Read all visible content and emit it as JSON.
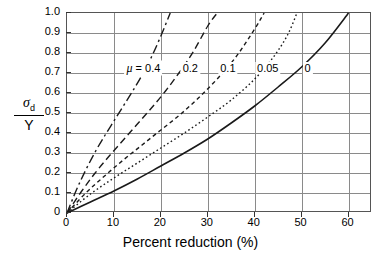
{
  "chart_data": {
    "type": "line",
    "title": "",
    "xlabel": "Percent reduction (%)",
    "ylabel": "σd/Y",
    "ylabel_numerator": "σ",
    "ylabel_numerator_sub": "d",
    "ylabel_denominator": "Y",
    "xlim": [
      0,
      65
    ],
    "ylim": [
      0,
      1.0
    ],
    "grid": true,
    "legend_position": "inline-on-curves",
    "xticks": [
      0,
      10,
      20,
      30,
      40,
      50,
      60
    ],
    "xticklabels": [
      "0",
      "10",
      "20",
      "30",
      "40",
      "50",
      "60"
    ],
    "yticks": [
      0,
      0.1,
      0.2,
      0.3,
      0.4,
      0.5,
      0.6,
      0.7,
      0.8,
      0.9,
      1.0
    ],
    "yticklabels": [
      "0",
      "0.1",
      "0.2",
      "0.3",
      "0.4",
      "0.5",
      "0.6",
      "0.7",
      "0.8",
      "0.9",
      "1.0"
    ],
    "series": [
      {
        "name": "μ = 0.4",
        "mu": 0.4,
        "label": "0.4",
        "label_prefix": "μ =",
        "linestyle": "dashdot",
        "color": "#1a1a1a",
        "x": [
          0,
          2,
          4,
          6,
          8,
          10,
          12,
          14,
          16,
          18,
          20,
          22
        ],
        "y": [
          0,
          0.115,
          0.215,
          0.305,
          0.385,
          0.46,
          0.535,
          0.61,
          0.69,
          0.78,
          0.885,
          1.0
        ]
      },
      {
        "name": "μ = 0.2",
        "mu": 0.2,
        "label": "0.2",
        "linestyle": "longdash",
        "color": "#1a1a1a",
        "x": [
          0,
          3,
          6,
          9,
          12,
          15,
          18,
          21,
          24,
          27,
          30,
          32
        ],
        "y": [
          0,
          0.105,
          0.2,
          0.285,
          0.365,
          0.445,
          0.525,
          0.61,
          0.705,
          0.81,
          0.935,
          1.0
        ]
      },
      {
        "name": "μ = 0.1",
        "mu": 0.1,
        "label": "0.1",
        "linestyle": "dashed",
        "color": "#1a1a1a",
        "x": [
          0,
          4,
          8,
          12,
          16,
          20,
          24,
          28,
          32,
          36,
          40,
          42
        ],
        "y": [
          0,
          0.1,
          0.185,
          0.265,
          0.34,
          0.415,
          0.49,
          0.575,
          0.67,
          0.78,
          0.92,
          1.0
        ]
      },
      {
        "name": "μ = 0.05",
        "mu": 0.05,
        "label": "0.05",
        "linestyle": "dotted",
        "color": "#1a1a1a",
        "x": [
          0,
          5,
          10,
          15,
          20,
          25,
          30,
          35,
          40,
          44,
          47,
          49
        ],
        "y": [
          0,
          0.095,
          0.175,
          0.25,
          0.325,
          0.4,
          0.48,
          0.565,
          0.67,
          0.78,
          0.89,
          1.0
        ]
      },
      {
        "name": "μ = 0",
        "mu": 0,
        "label": "0",
        "linestyle": "solid",
        "color": "#1a1a1a",
        "x": [
          0,
          5,
          10,
          15,
          20,
          25,
          30,
          35,
          40,
          45,
          50,
          55,
          60
        ],
        "y": [
          0,
          0.055,
          0.11,
          0.17,
          0.235,
          0.3,
          0.37,
          0.45,
          0.535,
          0.63,
          0.73,
          0.85,
          1.0
        ]
      }
    ],
    "curve_labels": [
      {
        "text": "μ = 0.4",
        "prefix": "μ =",
        "value": "0.4",
        "x": 16.5,
        "y": 0.72
      },
      {
        "text": "0.2",
        "value": "0.2",
        "x": 26.5,
        "y": 0.72
      },
      {
        "text": "0.1",
        "value": "0.1",
        "x": 34.5,
        "y": 0.72
      },
      {
        "text": "0.05",
        "value": "0.05",
        "x": 43.0,
        "y": 0.72
      },
      {
        "text": "0",
        "value": "0",
        "x": 51.5,
        "y": 0.72
      }
    ],
    "axis_color": "#555555",
    "grid_color": "#8a8a8a",
    "line_color": "#1a1a1a",
    "background": "#ffffff"
  }
}
